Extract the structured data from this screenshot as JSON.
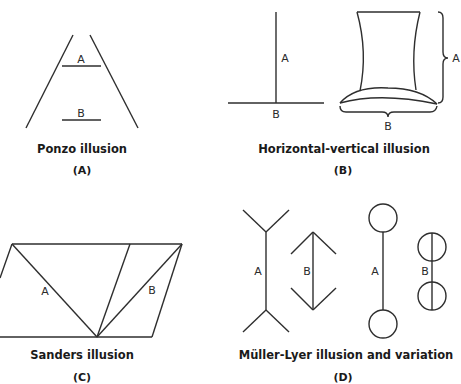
{
  "figures": [
    {
      "id": "A",
      "title": "Ponzo illusion",
      "tag": "(A)",
      "labels": [
        "A",
        "B"
      ]
    },
    {
      "id": "B",
      "title": "Horizontal-vertical illusion",
      "tag": "(B)",
      "labels": [
        "A",
        "B",
        "A",
        "B"
      ]
    },
    {
      "id": "C",
      "title": "Sanders illusion",
      "tag": "(C)",
      "labels": [
        "A",
        "B"
      ]
    },
    {
      "id": "D",
      "title": "Müller-Lyer illusion and variation",
      "tag": "(D)",
      "labels": [
        "A",
        "B",
        "A",
        "B"
      ]
    }
  ],
  "colors": {
    "stroke": "#2e2e2e",
    "background": "#ffffff"
  }
}
